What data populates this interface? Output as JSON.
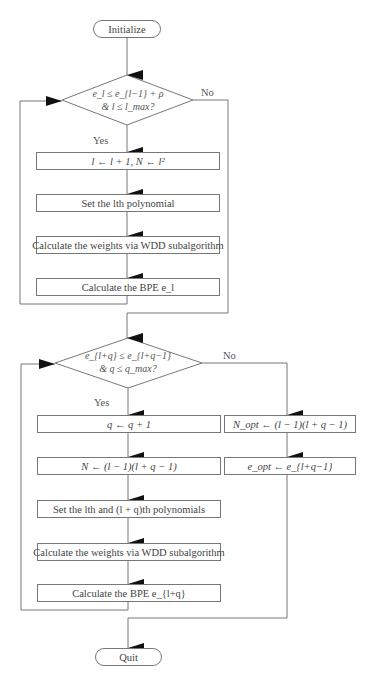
{
  "nodes": {
    "initialize": "Initialize",
    "decision1_line1": "e_l ≤ e_{l−1} + ρ",
    "decision1_line2": "& l ≤ l_max?",
    "box_l_update": "l ← l + 1, N ← l²",
    "box_set_lth": "Set the lth polynomial",
    "box_calc_weights_1": "Calculate the weights via WDD subalgorithm",
    "box_bpe_l": "Calculate the BPE e_l",
    "decision2_line1": "e_{l+q} ≤ e_{l+q−1}",
    "decision2_line2": "& q ≤ q_max?",
    "box_q_update": "q ← q + 1",
    "box_n_update": "N ← (l − 1)(l + q − 1)",
    "box_set_polys": "Set the lth and (l + q)th polynomials",
    "box_calc_weights_2": "Calculate the weights via WDD subalgorithm",
    "box_bpe_lq": "Calculate the BPE e_{l+q}",
    "box_nopt": "N_opt ← (l − 1)(l + q − 1)",
    "box_eopt": "e_opt ← e_{l+q−1}",
    "quit": "Quit"
  },
  "labels": {
    "yes1": "Yes",
    "no1": "No",
    "yes2": "Yes",
    "no2": "No"
  },
  "colors": {
    "line": "#777777",
    "arrow": "#111111",
    "text": "#444444",
    "background": "#ffffff"
  }
}
